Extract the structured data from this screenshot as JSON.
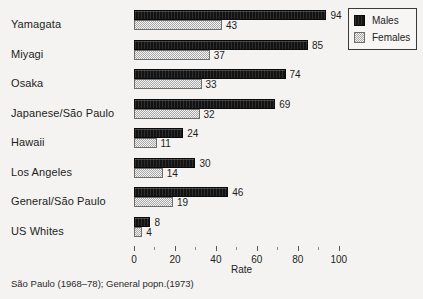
{
  "chart_data": {
    "type": "bar",
    "orientation": "horizontal",
    "title": "",
    "xlabel": "Rate",
    "ylabel": "",
    "xlim": [
      0,
      105
    ],
    "grid": false,
    "categories": [
      "Yamagata",
      "Miyagi",
      "Osaka",
      "Japanese/São Paulo",
      "Hawaii",
      "Los Angeles",
      "General/São Paulo",
      "US Whites"
    ],
    "series": [
      {
        "name": "Males",
        "color": "#131313",
        "values": [
          94,
          85,
          74,
          69,
          24,
          30,
          46,
          8
        ]
      },
      {
        "name": "Females",
        "color": "#c9c9c9",
        "values": [
          43,
          37,
          33,
          32,
          11,
          14,
          19,
          4
        ]
      }
    ],
    "xticks": [
      0,
      20,
      40,
      60,
      80,
      100
    ],
    "xticks_minor": [
      10,
      30,
      50,
      70,
      90
    ],
    "xtick_labels": [
      "0",
      "20",
      "40",
      "60",
      "80",
      "100"
    ],
    "legend_position": "top-right",
    "legend": [
      "Males",
      "Females"
    ],
    "caption": "São Paulo (1968–78); General popn.(1973)"
  }
}
